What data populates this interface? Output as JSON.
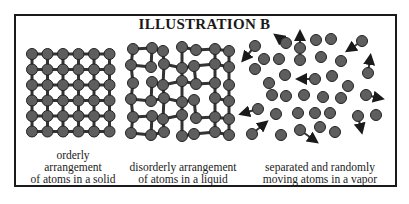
{
  "title": "ILLUSTRATION B",
  "panels": [
    {
      "name": "solid",
      "caption_lines": [
        "orderly",
        "arrangement",
        "of atoms in a solid"
      ]
    },
    {
      "name": "liquid",
      "caption_lines": [
        "disorderly arrangement",
        "of atoms in a liquid"
      ]
    },
    {
      "name": "vapor",
      "caption_lines": [
        "separated and randomly",
        "moving atoms in a vapor"
      ]
    }
  ],
  "colors": {
    "atom": "#5e5e5e",
    "atom_stroke": "#222222",
    "bond": "#333333",
    "frame": "#1a1a1a"
  }
}
